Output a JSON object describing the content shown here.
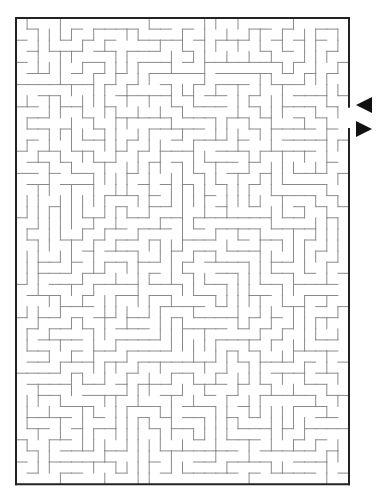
{
  "maze": {
    "origin_x": 16,
    "origin_y": 18,
    "cols": 30,
    "rows": 42,
    "cell": 11.1,
    "seed": 7321,
    "wall_color": "#8a8a8a",
    "border_color": "#222222",
    "wall_width": 1,
    "border_width": 2,
    "opening": {
      "side": "right",
      "row_start": 8,
      "row_end": 9
    }
  },
  "markers": {
    "entry_arrow": {
      "direction": "left",
      "x": 356,
      "y": 105,
      "color": "#111111"
    },
    "exit_arrow": {
      "direction": "right",
      "x": 356,
      "y": 129,
      "color": "#111111"
    }
  }
}
